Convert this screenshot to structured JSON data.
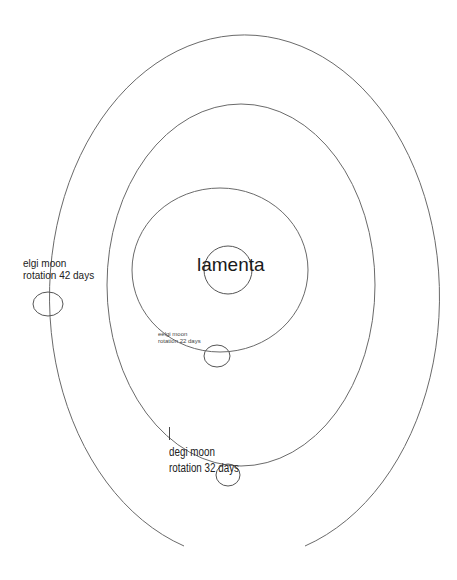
{
  "diagram": {
    "type": "orbital sketch",
    "planet": {
      "name": "lamenta",
      "center": [
        228,
        270
      ],
      "radius": 24
    },
    "orbits": [
      {
        "name": "inner-orbit",
        "center": [
          220,
          270
        ],
        "rx": 88,
        "ry": 82
      },
      {
        "name": "middle-orbit",
        "center": [
          241,
          285
        ],
        "rx": 134,
        "ry": 181
      },
      {
        "name": "outer-orbit",
        "center": [
          238,
          300
        ],
        "rx": 195,
        "ry": 262,
        "gap_bottom": true
      }
    ],
    "moons": [
      {
        "name": "eelgi moon",
        "rotation": "rotation 22 days",
        "center": [
          217,
          356
        ],
        "rx": 13,
        "ry": 11
      },
      {
        "name": "degi moon",
        "rotation": "rotation 32 days",
        "center": [
          228,
          475
        ],
        "rx": 12,
        "ry": 11,
        "mark": "I"
      },
      {
        "name": "elgi moon",
        "rotation": "rotation 42 days",
        "center": [
          48,
          304
        ],
        "rx": 15,
        "ry": 12
      }
    ],
    "colors": {
      "stroke": "#6a6a6a",
      "text": "#222222",
      "background": "#ffffff"
    }
  }
}
